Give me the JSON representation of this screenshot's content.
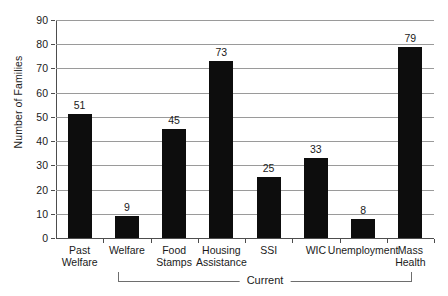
{
  "chart_data": {
    "type": "bar",
    "title": "",
    "xlabel": "",
    "ylabel": "Number of Families",
    "categories": [
      "Past Welfare",
      "Welfare",
      "Food Stamps",
      "Housing Assistance",
      "SSI",
      "WIC",
      "Unemployment",
      "Mass Health"
    ],
    "category_lines": [
      [
        "Past",
        "Welfare"
      ],
      [
        "Welfare",
        ""
      ],
      [
        "Food",
        "Stamps"
      ],
      [
        "Housing",
        "Assistance"
      ],
      [
        "SSI",
        ""
      ],
      [
        "WIC",
        ""
      ],
      [
        "Unemployment",
        ""
      ],
      [
        "Mass",
        "Health"
      ]
    ],
    "values": [
      51,
      9,
      45,
      73,
      25,
      33,
      8,
      79
    ],
    "ylim": [
      0,
      90
    ],
    "ytick_step": 10,
    "yticks": [
      0,
      10,
      20,
      30,
      40,
      50,
      60,
      70,
      80,
      90
    ],
    "ytick_labels": [
      "0",
      "10",
      "20",
      "30",
      "40",
      "50",
      "60",
      "70",
      "80",
      "90"
    ],
    "grid": true,
    "legend": false,
    "bar_color": "#0d0d0d",
    "gridline_color": "#9a9a9a",
    "axis_color": "#4d4d4d",
    "background_color": "#ffffff",
    "annotations": [
      {
        "name": "group-bracket",
        "label": "Current",
        "spans_categories": [
          "Welfare",
          "Mass Health"
        ]
      }
    ]
  }
}
